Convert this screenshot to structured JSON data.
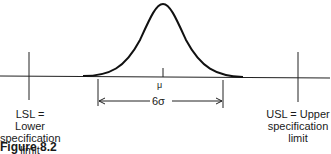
{
  "diagram": {
    "mean_label": "μ",
    "width_label": "6σ",
    "lsl": {
      "line1": "LSL = Lower",
      "line2": "specification",
      "line3": "limit"
    },
    "usl": {
      "line1": "USL = Upper",
      "line2": "specification",
      "line3": "limit"
    },
    "figure_caption": "Figure 8.2"
  }
}
